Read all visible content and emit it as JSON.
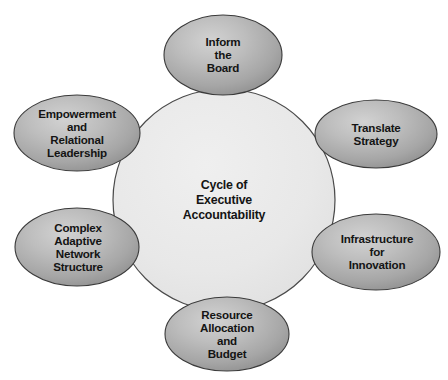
{
  "diagram": {
    "type": "hub-and-spoke-cycle",
    "title_shown_in_image": false,
    "background_color": "#ffffff",
    "hub": {
      "name": "cycle-of-executive-accountability",
      "label": "Cycle of\nExecutive\nAccountability",
      "shape": "circle",
      "fill_color": "#e9e9e9",
      "stroke_color": "#4a4a4a",
      "center": {
        "x": 224,
        "y": 200
      },
      "radius": 111
    },
    "satellite_style": {
      "shape": "ellipse",
      "fill_light": "#cfcfcf",
      "fill_dark": "#8f8f8f",
      "stroke_color": "#3a3a3a",
      "text_color": "#141414"
    },
    "satellites": [
      {
        "name": "inform-the-board",
        "label": "Inform\nthe\nBoard",
        "position": "top",
        "cx": 223,
        "cy": 55,
        "rx": 59,
        "ry": 40
      },
      {
        "name": "translate-strategy",
        "label": "Translate\nStrategy",
        "position": "upper-right",
        "cx": 376,
        "cy": 134,
        "rx": 61,
        "ry": 34
      },
      {
        "name": "infrastructure-for-innovation",
        "label": "Infrastructure\nfor\nInnovation",
        "position": "lower-right",
        "cx": 376,
        "cy": 252,
        "rx": 64,
        "ry": 38
      },
      {
        "name": "resource-allocation-and-budget",
        "label": "Resource\nAllocation\nand\nBudget",
        "position": "bottom",
        "cx": 227,
        "cy": 334,
        "rx": 62,
        "ry": 37
      },
      {
        "name": "complex-adaptive-network-structure",
        "label": "Complex\nAdaptive\nNetwork\nStructure",
        "position": "lower-left",
        "cx": 77,
        "cy": 247,
        "rx": 62,
        "ry": 39
      },
      {
        "name": "empowerment-and-relational-leadership",
        "label": "Empowerment\nand\nRelational\nLeadership",
        "position": "upper-left",
        "cx": 77,
        "cy": 133,
        "rx": 63,
        "ry": 38
      }
    ]
  }
}
